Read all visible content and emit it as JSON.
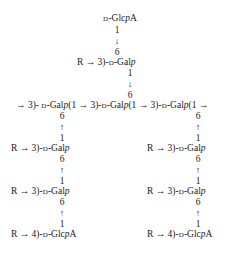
{
  "diagram": {
    "title": "",
    "top_branch": {
      "terminal": {
        "prefix": "D",
        "name": "-Glc",
        "ring": "p",
        "suffix": "A"
      },
      "link1": {
        "from": "1",
        "arrow": "↓",
        "to": "6"
      },
      "residue": {
        "substituent": "R → 3)-",
        "prefix": "D",
        "name": "-Gal",
        "ring": "p"
      },
      "link2": {
        "from": "1",
        "arrow": "↓",
        "to": "6"
      }
    },
    "main_chain": {
      "start": "→ 3)- ",
      "residues": [
        {
          "prefix": "D",
          "name": "-Gal",
          "ring": "p",
          "link": "(1 → 3)-"
        },
        {
          "prefix": "D",
          "name": "-Gal",
          "ring": "p",
          "link": "(1 → 3)-"
        },
        {
          "prefix": "D",
          "name": "-Gal",
          "ring": "p",
          "link": "(1 →"
        }
      ]
    },
    "left_branch": {
      "link1": {
        "to": "6",
        "arrow": "↑",
        "from": "1"
      },
      "residue1": {
        "substituent": "R → 3)-",
        "prefix": "D",
        "name": "-Gal",
        "ring": "p"
      },
      "link2": {
        "to": "6",
        "arrow": "↑",
        "from": "1"
      },
      "residue2": {
        "substituent": "R → 3)-",
        "prefix": "D",
        "name": "-Gal",
        "ring": "p"
      },
      "link3": {
        "to": "6",
        "arrow": "↑",
        "from": "1"
      },
      "terminal": {
        "substituent": "R → 4)-",
        "prefix": "D",
        "name": "-Glc",
        "ring": "p",
        "suffix": "A"
      }
    },
    "right_branch": {
      "link1": {
        "to": "6",
        "arrow": "↑",
        "from": "1"
      },
      "residue1": {
        "substituent": "R → 3)-",
        "prefix": "D",
        "name": "-Gal",
        "ring": "p"
      },
      "link2": {
        "to": "6",
        "arrow": "↑",
        "from": "1"
      },
      "residue2": {
        "substituent": "R → 3)-",
        "prefix": "D",
        "name": "-Gal",
        "ring": "p"
      },
      "link3": {
        "to": "6",
        "arrow": "↑",
        "from": "1"
      },
      "terminal": {
        "substituent": "R → 4)-",
        "prefix": "D",
        "name": "-Glc",
        "ring": "p",
        "suffix": "A"
      }
    }
  }
}
